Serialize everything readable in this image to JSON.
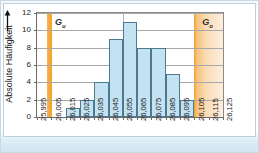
{
  "figure": {
    "y_axis_label": "Absolute Häufigkeit",
    "y_axis_arrow": "up-arrow",
    "band_lower_label": "G",
    "band_lower_sub": "u",
    "band_upper_label": "G",
    "band_upper_sub": "o",
    "colors": {
      "bar_fill": "#c3e3f2",
      "bar_stroke": "#4d7a91",
      "band_lower": "#f5a93c",
      "band_upper": "#fbdcb4",
      "grid": "#a8a8a8",
      "axis": "#6b6b6b",
      "frame": "#bfcfdb"
    }
  },
  "chart_data": {
    "type": "bar",
    "title": "",
    "subtitle": "",
    "xlabel": "",
    "ylabel": "Absolute Häufigkeit",
    "grid": true,
    "legend": "none",
    "ylim": [
      0,
      12
    ],
    "yticks": [
      0,
      2,
      4,
      6,
      8,
      10,
      12
    ],
    "xticks": [
      "25,995",
      "26,005",
      "26,015",
      "26,025",
      "26,035",
      "26,045",
      "26,055",
      "26,065",
      "26,075",
      "26,085",
      "26,095",
      "26,105",
      "26,115",
      "26,125"
    ],
    "bin_edges": [
      "25,995",
      "26,005",
      "26,015",
      "26,025",
      "26,035",
      "26,045",
      "26,055",
      "26,065",
      "26,075",
      "26,085",
      "26,095",
      "26,105",
      "26,115",
      "26,125"
    ],
    "categories": [
      "25,995–26,005",
      "26,005–26,015",
      "26,015–26,025",
      "26,025–26,035",
      "26,035–26,045",
      "26,045–26,055",
      "26,055–26,065",
      "26,065–26,075",
      "26,075–26,085",
      "26,085–26,095",
      "26,095–26,105",
      "26,105–26,115",
      "26,115–26,125"
    ],
    "values": [
      0,
      0,
      1,
      2,
      4,
      9,
      11,
      8,
      8,
      5,
      2,
      0,
      0
    ],
    "annotations": [
      {
        "name": "Gu",
        "text": "G_u",
        "type": "tolerance-band-lower",
        "x_position": "26,002"
      },
      {
        "name": "Go",
        "text": "G_o",
        "type": "tolerance-band-upper",
        "x_position": "26,103"
      }
    ]
  }
}
